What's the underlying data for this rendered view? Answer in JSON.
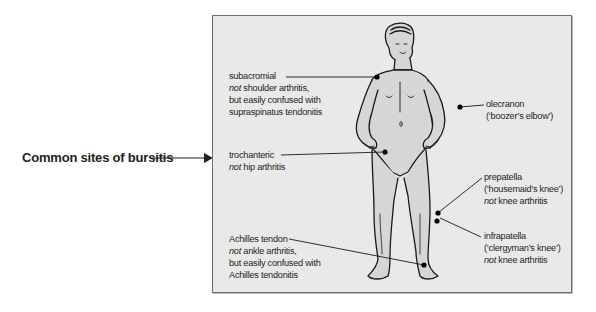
{
  "title": "Common sites of bursitis",
  "annotations": {
    "subacromial": {
      "name": "subacromial",
      "lines": [
        {
          "italic": "not",
          "rest": " shoulder arthritis,"
        },
        {
          "italic": "",
          "rest": "but easily confused with"
        },
        {
          "italic": "",
          "rest": "supraspinatus tendonitis"
        }
      ]
    },
    "trochanteric": {
      "name": "trochanteric",
      "lines": [
        {
          "italic": "not",
          "rest": " hip arthritis"
        }
      ]
    },
    "achilles": {
      "name": "Achilles tendon",
      "lines": [
        {
          "italic": "not",
          "rest": " ankle arthritis,"
        },
        {
          "italic": "",
          "rest": "but easily confused with"
        },
        {
          "italic": "",
          "rest": "Achilles tendonitis"
        }
      ]
    },
    "olecranon": {
      "name": "olecranon",
      "lines": [
        {
          "italic": "",
          "rest": "(‘boozer’s elbow’)"
        }
      ]
    },
    "prepatella": {
      "name": "prepatella",
      "lines": [
        {
          "italic": "",
          "rest": "(‘housemaid’s knee’)"
        },
        {
          "italic": "not",
          "rest": " knee arthritis"
        }
      ]
    },
    "infrapatella": {
      "name": "infrapatella",
      "lines": [
        {
          "italic": "",
          "rest": "(‘clergyman’s knee’)"
        },
        {
          "italic": "not",
          "rest": " knee arthritis"
        }
      ]
    }
  },
  "colors": {
    "panel_bg": "#e9e9e9",
    "panel_border": "#6e6e6e",
    "body_fill": "#d6d6d6",
    "outline": "#1a1a1a",
    "text": "#231f20"
  }
}
